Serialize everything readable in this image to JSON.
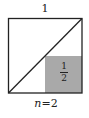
{
  "diagram": {
    "top_label": "1",
    "shaded_region": {
      "numerator": "1",
      "denominator": "2",
      "color": "#a9a9a9"
    },
    "bottom_label": {
      "variable": "n",
      "equals": "=",
      "value": "2"
    },
    "colors": {
      "stroke": "#222222",
      "background": "#ffffff",
      "shade": "#a9a9a9"
    }
  }
}
